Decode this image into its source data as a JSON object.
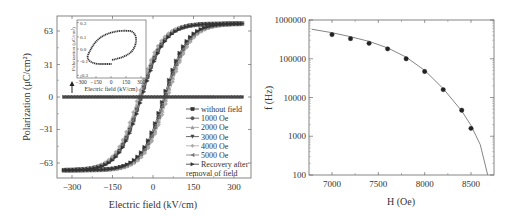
{
  "chart_data": [
    {
      "type": "line",
      "title": "",
      "xlabel": "Electric field (kV/cm)",
      "ylabel": "Polarization (μC/cm²)",
      "xlim": [
        -340,
        340
      ],
      "ylim": [
        -78,
        78
      ],
      "xticks": [
        "-300",
        "-150",
        "0",
        "150",
        "300"
      ],
      "yticks": [
        "63",
        "31",
        "0",
        "-31",
        "-63"
      ],
      "grid": false,
      "legend_position": "lower right",
      "legend": [
        "without field",
        "1000 Oe",
        "2000 Oe",
        "3000 Oe",
        "4000 Oe",
        "5000 Oe",
        "Recovery after removal of field"
      ],
      "series": [
        {
          "name": "without field",
          "marker": "square",
          "color": "#333333",
          "description": "flat line at P=0",
          "x": [
            -330,
            330
          ],
          "y": [
            0,
            0
          ]
        },
        {
          "name": "1000 Oe",
          "marker": "circle",
          "color": "#555555",
          "coercive_field": 45,
          "Pmax": 68
        },
        {
          "name": "2000 Oe",
          "marker": "triangle-up",
          "color": "#999999",
          "coercive_field": 50,
          "Pmax": 68
        },
        {
          "name": "3000 Oe",
          "marker": "triangle-down",
          "color": "#444444",
          "coercive_field": 45,
          "Pmax": 68
        },
        {
          "name": "4000 Oe",
          "marker": "diamond",
          "color": "#aaaaaa",
          "coercive_field": 55,
          "Pmax": 68
        },
        {
          "name": "5000 Oe",
          "marker": "triangle-left",
          "color": "#777777",
          "coercive_field": 45,
          "Pmax": 68
        },
        {
          "name": "Recovery after removal of field",
          "marker": "triangle-right",
          "color": "#333333",
          "coercive_field": 40,
          "Pmax": 68
        }
      ],
      "inset": {
        "xlabel": "Electric field (kV/cm)",
        "ylabel": "Polarization (μC/cm²)",
        "xticks": [
          "-300",
          "-150",
          "0",
          "150",
          "300"
        ],
        "yticks": [
          "0.3",
          "0.1",
          "0.0",
          "-0.1",
          "-0.3"
        ],
        "description": "small loop of 'without field' sample, P range about -0.13 to 0.13"
      },
      "annotation": "arrow pointing from inset to flat line"
    },
    {
      "type": "scatter",
      "title": "",
      "xlabel": "H (Oe)",
      "ylabel": "f (Hz)",
      "yscale": "log",
      "xlim": [
        6780,
        8740
      ],
      "ylim": [
        100,
        1000000
      ],
      "xticks": [
        "7000",
        "7500",
        "8000",
        "8500"
      ],
      "yticks": [
        "1000000",
        "100000",
        "10000",
        "1000",
        "100"
      ],
      "grid": false,
      "series": [
        {
          "name": "data",
          "marker": "circle",
          "color": "#222222",
          "x": [
            7000,
            7200,
            7400,
            7600,
            7800,
            8000,
            8200,
            8400,
            8500
          ],
          "y": [
            420000,
            330000,
            250000,
            180000,
            100000,
            47000,
            16000,
            4700,
            1600
          ]
        },
        {
          "name": "fit",
          "type": "line",
          "color": "#777777",
          "x": [
            6780,
            7000,
            7200,
            7400,
            7600,
            7800,
            8000,
            8200,
            8400,
            8500,
            8600,
            8680
          ],
          "y": [
            580000,
            470000,
            370000,
            280000,
            190000,
            110000,
            50000,
            17000,
            4500,
            1900,
            600,
            100
          ]
        }
      ]
    }
  ]
}
